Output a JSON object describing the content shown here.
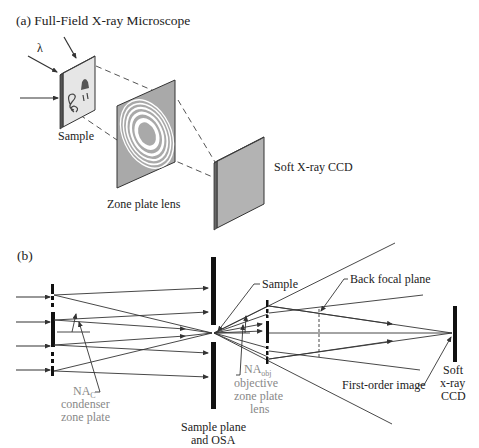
{
  "panel_a": {
    "title": "(a) Full-Field X-ray Microscope",
    "wavelength_symbol": "λ",
    "labels": {
      "sample": "Sample",
      "zone_plate": "Zone plate lens",
      "ccd": "Soft X-ray CCD"
    }
  },
  "panel_b": {
    "title": "(b)",
    "labels": {
      "na_c": "NA",
      "na_c_sub": "C",
      "condenser_1": "condenser",
      "condenser_2": "zone plate",
      "sample_plane_1": "Sample plane",
      "sample_plane_2": "and OSA",
      "sample": "Sample",
      "na_obj": "NA",
      "na_obj_sub": "obj",
      "objective_1": "objective",
      "objective_2": "zone plate",
      "objective_3": "lens",
      "back_focal_plane": "Back focal plane",
      "first_order_image": "First-order image",
      "ccd_1": "Soft",
      "ccd_2": "x-ray",
      "ccd_3": "CCD"
    }
  },
  "colors": {
    "line": "#333333",
    "panel_gray": "#a9a9a9",
    "ccd_gray": "#b3b3b3",
    "label_gray": "#888888"
  }
}
